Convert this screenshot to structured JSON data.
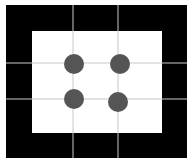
{
  "diagram": {
    "background": "#ffffff",
    "frame": {
      "x": 6,
      "y": 5,
      "width": 181,
      "height": 153,
      "color": "#000000"
    },
    "inner": {
      "x": 32,
      "y": 31,
      "width": 130,
      "height": 102,
      "color": "#ffffff"
    },
    "grid": {
      "color": "#c8c8c8",
      "vertical_x": [
        73,
        118
      ],
      "horizontal_y": [
        63,
        99
      ]
    },
    "dots": {
      "color": "#555555",
      "radius": 10,
      "points": [
        {
          "cx": 74,
          "cy": 64
        },
        {
          "cx": 120,
          "cy": 64
        },
        {
          "cx": 74,
          "cy": 99
        },
        {
          "cx": 118,
          "cy": 102
        }
      ]
    }
  }
}
